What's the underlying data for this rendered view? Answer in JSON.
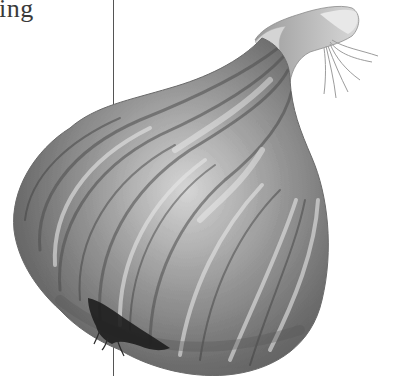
{
  "page": {
    "heading_fragment": "ing",
    "image": {
      "subject": "garlic bulb",
      "style": "grayscale photograph",
      "icon": "garlic-bulb-image"
    },
    "colors": {
      "background": "#ffffff",
      "text": "#3a3a3a",
      "rule": "#555555"
    }
  }
}
